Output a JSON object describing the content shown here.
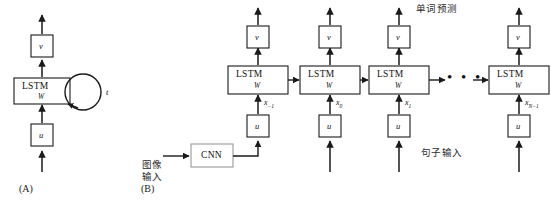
{
  "figure": {
    "panels": [
      {
        "id": "A",
        "caption": "(A)"
      },
      {
        "id": "B",
        "caption": "(B)"
      }
    ],
    "annotations": {
      "word_prediction": "单词预测",
      "sentence_input": "句子输入",
      "image_input_line1": "图像",
      "image_input_line2": "输入"
    },
    "colors": {
      "stroke": "#1a1a1a",
      "box_fill": "#ffffff",
      "background": "#ffffff",
      "text": "#111111"
    }
  },
  "panel_a": {
    "output_box": {
      "label": "v"
    },
    "cell_box": {
      "label": "LSTM",
      "sublabel": "W"
    },
    "input_box": {
      "label": "u"
    },
    "recurrence_label": "t"
  },
  "panel_b": {
    "cnn_box": {
      "label": "CNN"
    },
    "dots": "• • •",
    "columns": [
      {
        "output_box": {
          "label": "v"
        },
        "cell_box": {
          "label": "LSTM",
          "sublabel": "W"
        },
        "input_box": {
          "label": "u"
        },
        "x_label": "x",
        "x_subscript": "−1"
      },
      {
        "output_box": {
          "label": "v"
        },
        "cell_box": {
          "label": "LSTM",
          "sublabel": "W"
        },
        "input_box": {
          "label": "u"
        },
        "x_label": "x",
        "x_subscript": "0"
      },
      {
        "output_box": {
          "label": "v"
        },
        "cell_box": {
          "label": "LSTM",
          "sublabel": "W"
        },
        "input_box": {
          "label": "u"
        },
        "x_label": "x",
        "x_subscript": "1"
      },
      {
        "output_box": {
          "label": "v"
        },
        "cell_box": {
          "label": "LSTM",
          "sublabel": "W"
        },
        "input_box": {
          "label": "u"
        },
        "x_label": "x",
        "x_subscript": "N−1"
      }
    ]
  }
}
